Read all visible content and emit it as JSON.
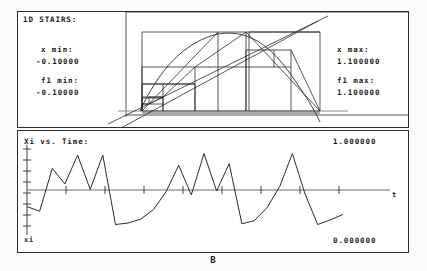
{
  "app": {
    "caption": "B"
  },
  "panel_top": {
    "title": "1D STAIRS:",
    "x_min_label": "x min:",
    "x_min_value": "-0.10000",
    "f1_min_label": "f1 min:",
    "f1_min_value": "-0.10000",
    "x_max_label": "x max:",
    "x_max_value": "1.100000",
    "f1_max_label": "f1 max:",
    "f1_max_value": "1.100000"
  },
  "panel_bottom": {
    "title": "Xi vs. Time:",
    "max_value": "1.000000",
    "min_value": "0.000000",
    "y_axis_label": "xi",
    "t_axis_label": "t"
  },
  "colors": {
    "ink": "#1a1a1a",
    "frame": "#2b2b2b",
    "plot_line": "#2b2b2b",
    "axis": "#555555",
    "background": "#ffffff"
  },
  "chart_data": [
    {
      "type": "line",
      "name": "cobweb-stairs-diagram",
      "title": "1D STAIRS:",
      "xlabel": "x",
      "ylabel": "f1(x)",
      "xlim": [
        -0.1,
        1.1
      ],
      "ylim": [
        -0.1,
        1.1
      ],
      "grid": false,
      "legend": "none",
      "series": [
        {
          "name": "map-function",
          "comment": "unimodal parabola-like map f(x)",
          "x": [
            0.0,
            0.05,
            0.1,
            0.15,
            0.2,
            0.25,
            0.3,
            0.35,
            0.4,
            0.45,
            0.5,
            0.55,
            0.6,
            0.65,
            0.7,
            0.75,
            0.8,
            0.85,
            0.9,
            0.95,
            1.0
          ],
          "y": [
            0.0,
            0.19,
            0.36,
            0.51,
            0.64,
            0.75,
            0.84,
            0.91,
            0.96,
            0.99,
            1.0,
            0.99,
            0.96,
            0.91,
            0.84,
            0.75,
            0.64,
            0.51,
            0.36,
            0.19,
            0.0
          ]
        },
        {
          "name": "identity-line",
          "comment": "y = x diagonal",
          "x": [
            -0.1,
            1.1
          ],
          "y": [
            -0.1,
            1.1
          ]
        },
        {
          "name": "cobweb-orbit",
          "comment": "stair-step iteration path x -> f(x) -> x",
          "x": [
            0.025,
            0.025,
            0.098,
            0.098,
            0.098,
            0.098,
            0.353,
            0.353,
            0.353,
            0.353,
            0.913,
            0.913,
            0.913,
            0.913,
            0.317,
            0.317,
            0.317,
            0.317,
            0.866,
            0.866,
            0.866,
            0.866,
            0.464,
            0.464,
            0.464,
            0.464,
            0.995,
            0.995,
            0.995,
            0.995,
            0.021,
            0.021
          ],
          "y": [
            0.0,
            0.098,
            0.098,
            0.098,
            0.098,
            0.353,
            0.353,
            0.353,
            0.353,
            0.913,
            0.913,
            0.913,
            0.913,
            0.317,
            0.317,
            0.317,
            0.317,
            0.866,
            0.866,
            0.866,
            0.866,
            0.464,
            0.464,
            0.464,
            0.464,
            0.995,
            0.995,
            0.995,
            0.995,
            0.021,
            0.021,
            0.021
          ]
        }
      ]
    },
    {
      "type": "line",
      "name": "time-series",
      "title": "Xi vs. Time:",
      "xlabel": "t",
      "ylabel": "xi",
      "ylim": [
        0.0,
        1.0
      ],
      "ymax_label": "1.000000",
      "ymin_label": "0.000000",
      "grid": false,
      "legend": "none",
      "x_ticks_count": 9,
      "y_ticks_count": 8,
      "values": [
        0.3,
        0.24,
        0.79,
        0.59,
        0.96,
        0.52,
        0.96,
        0.07,
        0.09,
        0.14,
        0.26,
        0.49,
        0.83,
        0.45,
        0.98,
        0.5,
        0.85,
        0.08,
        0.12,
        0.29,
        0.56,
        0.98,
        0.46,
        0.07,
        0.13,
        0.2
      ]
    }
  ]
}
